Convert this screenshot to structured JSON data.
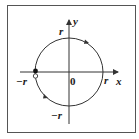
{
  "diagram": {
    "axes": {
      "x_label": "x",
      "y_label": "y",
      "origin_label": "0"
    },
    "circle": {
      "radius_label": "r",
      "direction": "counterclockwise"
    },
    "labels": {
      "y_top": "r",
      "x_right": "r",
      "x_left": "−r",
      "y_bottom": "−r"
    },
    "points": [
      {
        "name": "filled-point",
        "position": "(-r, 0) upper",
        "filled": true
      },
      {
        "name": "open-point",
        "position": "(-r, 0) lower",
        "filled": false
      }
    ],
    "colors": {
      "stroke": "#333333",
      "background": "#ffffff",
      "frame": "#555555"
    }
  }
}
